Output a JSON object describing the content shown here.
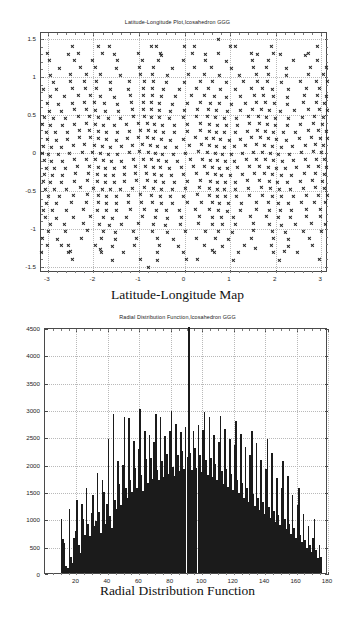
{
  "figure": {
    "top": {
      "title": "Latitude-Longitude Plot,Icosahedron GGG",
      "caption": "Latitude-Longitude Map",
      "marker": "x-cross-marker",
      "marker_color": "#262626"
    },
    "bottom": {
      "title": "Radial Distribution Function,Icosahedron GGG",
      "caption": "Radial Distribution Function",
      "bar_color": "#1b1b1b"
    }
  },
  "chart_data": [
    {
      "type": "scatter",
      "title": "Latitude-Longitude Plot,Icosahedron GGG",
      "caption": "Latitude-Longitude Map",
      "xlabel": "",
      "ylabel": "",
      "xlim": [
        -3.15,
        3.15
      ],
      "ylim": [
        -1.58,
        1.58
      ],
      "grid": true,
      "legend": false,
      "marker": "x",
      "xticks": [
        -3,
        -2,
        -1,
        0,
        1,
        2,
        3
      ],
      "xticklabels": [
        "-3",
        "-2",
        "-1",
        "0",
        "1",
        "2",
        "3"
      ],
      "yticks": [
        -1.5,
        -1,
        -0.5,
        0,
        0.5,
        1,
        1.5
      ],
      "yticklabels": [
        "-1.5",
        "-1",
        "-0.5",
        "0",
        "0.5",
        "1",
        "1.5"
      ],
      "n_points": 642,
      "description": "Longitude (radians) versus latitude (radians) of an icosahedral geodesic grid; points densest near equator and thin toward the poles, with curved void arcs from the icosahedral tiling.",
      "generator": {
        "scheme": "icosahedral-geodesic",
        "subdivision": 8,
        "lat_rows": 33,
        "lon_span": [
          -3.1416,
          3.1416
        ],
        "lat_span": [
          -1.5708,
          1.5708
        ]
      }
    },
    {
      "type": "bar",
      "title": "Radial Distribution Function,Icosahedron GGG",
      "caption": "Radial Distribution Function",
      "xlabel": "",
      "ylabel": "",
      "xlim": [
        0,
        180
      ],
      "ylim": [
        0,
        4500
      ],
      "grid": true,
      "legend": false,
      "xticks": [
        20,
        40,
        60,
        80,
        100,
        120,
        140,
        160,
        180
      ],
      "xticklabels": [
        "20",
        "40",
        "60",
        "80",
        "100",
        "120",
        "140",
        "160",
        "180"
      ],
      "yticks": [
        0,
        500,
        1000,
        1500,
        2000,
        2500,
        3000,
        3500,
        4000,
        4500
      ],
      "yticklabels": [
        "0",
        "500",
        "1000",
        "1500",
        "2000",
        "2500",
        "3000",
        "3500",
        "4000",
        "4500"
      ],
      "bin_width": 1,
      "clipped_peak": {
        "x": 92,
        "value_exceeds": 4500,
        "note": "central spike clipped at top of axis"
      },
      "description": "Histogram of pairwise angular separations (degrees) for icosahedral geodesic grid points; spiky discrete structure, envelope peaking near 90 degrees.",
      "x": [
        10,
        11,
        12,
        13,
        14,
        15,
        16,
        17,
        18,
        19,
        20,
        21,
        22,
        23,
        24,
        25,
        26,
        27,
        28,
        29,
        30,
        31,
        32,
        33,
        34,
        35,
        36,
        37,
        38,
        39,
        40,
        41,
        42,
        43,
        44,
        45,
        46,
        47,
        48,
        49,
        50,
        51,
        52,
        53,
        54,
        55,
        56,
        57,
        58,
        59,
        60,
        61,
        62,
        63,
        64,
        65,
        66,
        67,
        68,
        69,
        70,
        71,
        72,
        73,
        74,
        75,
        76,
        77,
        78,
        79,
        80,
        81,
        82,
        83,
        84,
        85,
        86,
        87,
        88,
        89,
        90,
        91,
        92,
        93,
        94,
        95,
        96,
        97,
        98,
        99,
        100,
        101,
        102,
        103,
        104,
        105,
        106,
        107,
        108,
        109,
        110,
        111,
        112,
        113,
        114,
        115,
        116,
        117,
        118,
        119,
        120,
        121,
        122,
        123,
        124,
        125,
        126,
        127,
        128,
        129,
        130,
        131,
        132,
        133,
        134,
        135,
        136,
        137,
        138,
        139,
        140,
        141,
        142,
        143,
        144,
        145,
        146,
        147,
        148,
        149,
        150,
        151,
        152,
        153,
        154,
        155,
        156,
        157,
        158,
        159,
        160,
        161,
        162,
        163,
        164,
        165,
        166,
        167,
        168,
        169,
        170,
        171,
        172,
        173,
        174,
        175
      ],
      "values": [
        980,
        620,
        540,
        120,
        100,
        1180,
        300,
        180,
        640,
        760,
        1330,
        520,
        360,
        1260,
        980,
        700,
        1560,
        900,
        680,
        1100,
        1420,
        860,
        960,
        1830,
        1120,
        740,
        1700,
        1480,
        900,
        1260,
        2450,
        1040,
        820,
        2900,
        1340,
        1180,
        2050,
        1620,
        1240,
        1980,
        2860,
        1560,
        1380,
        2840,
        1700,
        1480,
        2420,
        1920,
        1560,
        2260,
        3000,
        1800,
        1500,
        2600,
        2080,
        1640,
        2520,
        2100,
        1720,
        2400,
        2900,
        1880,
        1700,
        2860,
        2040,
        1760,
        2500,
        2180,
        1820,
        2600,
        2960,
        1940,
        1780,
        2720,
        2150,
        1860,
        2580,
        2240,
        1900,
        2680,
        2120,
        4500,
        2200,
        1880,
        2600,
        2280,
        1920,
        2700,
        2160,
        1840,
        2620,
        2940,
        2060,
        1800,
        2860,
        2100,
        1760,
        2520,
        2000,
        1700,
        2400,
        2880,
        1860,
        1620,
        2640,
        1900,
        1580,
        2460,
        1820,
        1520,
        2340,
        2780,
        1700,
        1460,
        2540,
        1640,
        1380,
        2300,
        1560,
        1300,
        2150,
        2600,
        1440,
        1220,
        2380,
        1380,
        1160,
        2060,
        1300,
        1080,
        1900,
        2460,
        1200,
        1000,
        2200,
        1140,
        940,
        1740,
        1060,
        880,
        1560,
        2050,
        980,
        800,
        1780,
        900,
        720,
        1420,
        820,
        640,
        1240,
        1560,
        700,
        560,
        1080,
        600,
        460,
        860,
        520,
        380,
        640,
        980,
        420,
        280,
        520,
        300,
        200,
        360,
        220,
        140,
        260,
        740,
        160,
        100,
        180
      ],
      "note_left_edge": "first bars begin near 10 degrees; near-zero density below 10",
      "note_right_edge": "distribution falls to near zero past about 175 degrees with an isolated bar near 170"
    }
  ]
}
